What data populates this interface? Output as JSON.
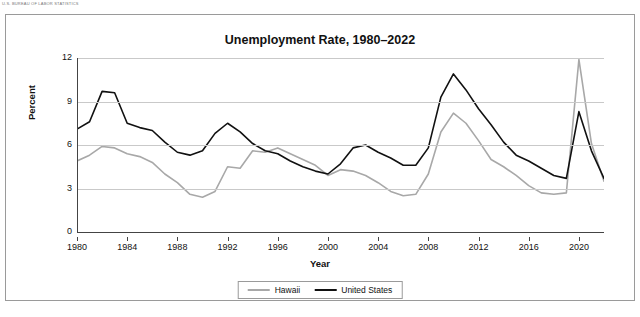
{
  "topnote": "U.S. BUREAU OF LABOR STATISTICS",
  "chart_data": {
    "type": "line",
    "title": "Unemployment Rate, 1980–2022",
    "xlabel": "Year",
    "ylabel": "Percent",
    "xlim": [
      1980,
      2022
    ],
    "ylim": [
      0,
      12
    ],
    "yticks": [
      "0",
      "3",
      "6",
      "9",
      "12"
    ],
    "ytick_values": [
      0,
      3,
      6,
      9,
      12
    ],
    "xticks": [
      "1980",
      "1984",
      "1988",
      "1992",
      "1996",
      "2000",
      "2004",
      "2008",
      "2012",
      "2016",
      "2020"
    ],
    "xtick_values": [
      1980,
      1984,
      1988,
      1992,
      1996,
      2000,
      2004,
      2008,
      2012,
      2016,
      2020
    ],
    "grid": true,
    "legend_position": "bottom",
    "x": [
      1980,
      1981,
      1982,
      1983,
      1984,
      1985,
      1986,
      1987,
      1988,
      1989,
      1990,
      1991,
      1992,
      1993,
      1994,
      1995,
      1996,
      1997,
      1998,
      1999,
      2000,
      2001,
      2002,
      2003,
      2004,
      2005,
      2006,
      2007,
      2008,
      2009,
      2010,
      2011,
      2012,
      2013,
      2014,
      2015,
      2016,
      2017,
      2018,
      2019,
      2020,
      2021,
      2022
    ],
    "series": [
      {
        "name": "Hawaii",
        "color": "#a8a8a8",
        "values": [
          4.9,
          5.3,
          5.9,
          5.8,
          5.4,
          5.2,
          4.8,
          4.0,
          3.4,
          2.6,
          2.4,
          2.8,
          4.5,
          4.4,
          5.6,
          5.5,
          5.8,
          5.4,
          5.0,
          4.6,
          3.9,
          4.3,
          4.2,
          3.9,
          3.4,
          2.8,
          2.5,
          2.6,
          4.0,
          6.9,
          8.2,
          7.5,
          6.3,
          5.0,
          4.5,
          3.9,
          3.2,
          2.7,
          2.6,
          2.7,
          11.9,
          6.1,
          3.5
        ]
      },
      {
        "name": "United States",
        "color": "#111111",
        "values": [
          7.1,
          7.6,
          9.7,
          9.6,
          7.5,
          7.2,
          7.0,
          6.2,
          5.5,
          5.3,
          5.6,
          6.8,
          7.5,
          6.9,
          6.1,
          5.6,
          5.4,
          4.9,
          4.5,
          4.2,
          4.0,
          4.7,
          5.8,
          6.0,
          5.5,
          5.1,
          4.6,
          4.6,
          5.8,
          9.3,
          10.9,
          9.8,
          8.5,
          7.4,
          6.2,
          5.3,
          4.9,
          4.4,
          3.9,
          3.7,
          8.3,
          5.6,
          3.7
        ]
      }
    ],
    "legend": [
      {
        "label": "Hawaii",
        "color": "#a8a8a8"
      },
      {
        "label": "United States",
        "color": "#111111"
      }
    ]
  }
}
